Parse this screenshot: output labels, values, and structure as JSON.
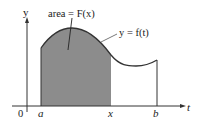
{
  "diagram": {
    "axes": {
      "x_label": "t",
      "y_label": "y",
      "origin_label": "0"
    },
    "ticks": [
      {
        "label": "a"
      },
      {
        "label": "x"
      },
      {
        "label": "b"
      }
    ],
    "annotations": {
      "area_label": "area = F(x)",
      "curve_label": "y = f(t)"
    },
    "colors": {
      "shaded_region": "#8c8c8c",
      "curve": "#333333",
      "axes": "#333333",
      "background": "#ffffff"
    }
  }
}
